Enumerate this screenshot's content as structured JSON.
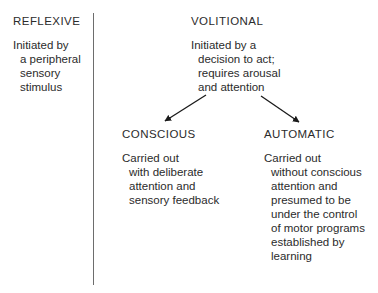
{
  "figure": {
    "background_color": "#ffffff",
    "text_color": "#2b2b2b",
    "divider_color": "#6d6d6d",
    "arrow_color": "#1a1a1a"
  },
  "columns": {
    "reflexive": {
      "heading": "REFLEXIVE",
      "lines": [
        "Initiated by",
        "a peripheral",
        "sensory",
        "stimulus"
      ]
    },
    "volitional": {
      "heading": "VOLITIONAL",
      "lines": [
        "Initiated by a",
        "decision to act;",
        "requires arousal",
        "and attention"
      ]
    },
    "conscious": {
      "heading": "CONSCIOUS",
      "lines": [
        "Carried out",
        "with deliberate",
        "attention and",
        "sensory feedback"
      ]
    },
    "automatic": {
      "heading": "AUTOMATIC",
      "lines": [
        "Carried out",
        "without conscious",
        "attention and",
        "presumed to be",
        "under the control",
        "of motor programs",
        "established by",
        "learning"
      ]
    }
  },
  "connectors": [
    {
      "name": "arrow-volitional-to-conscious",
      "from_x": 206,
      "from_y": 95,
      "to_x": 165,
      "to_y": 121
    },
    {
      "name": "arrow-volitional-to-automatic",
      "from_x": 261,
      "from_y": 96,
      "to_x": 299,
      "to_y": 122
    }
  ]
}
